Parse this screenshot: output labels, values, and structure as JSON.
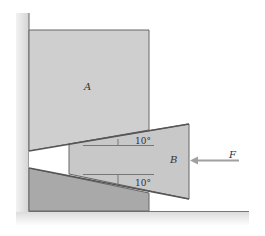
{
  "diagram": {
    "type": "wedge-statics",
    "labels": {
      "block_a": "A",
      "wedge_b": "B",
      "force": "F",
      "top_angle": "10°",
      "bottom_angle": "10°"
    },
    "colors": {
      "background": "#ffffff",
      "block_a_fill": "#cfcfcf",
      "wedge_b_fill": "#c8c8c8",
      "lower_block_fill": "#a9a9a9",
      "wall_fill": "#dedede",
      "floor_fill": "#e4e4e4",
      "edge": "#666666",
      "arrow": "#a0a0a0",
      "text": "#333333"
    }
  }
}
